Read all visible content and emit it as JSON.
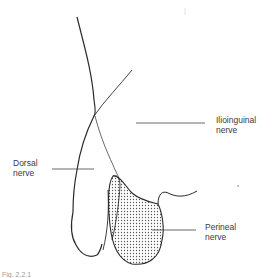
{
  "diagram": {
    "type": "anatomical-line-drawing",
    "colors": {
      "stroke": "#2a2a2a",
      "leader": "#444444",
      "stipple": "#555555",
      "background": "#ffffff"
    }
  },
  "labels": {
    "ilioinguinal": {
      "line1": "Ilioinguinal",
      "line2": "nerve"
    },
    "dorsal": {
      "line1": "Dorsal",
      "line2": "nerve"
    },
    "perineal": {
      "line1": "Perineal",
      "line2": "nerve"
    }
  },
  "caption": {
    "text": "Fig. 2.2.1"
  }
}
